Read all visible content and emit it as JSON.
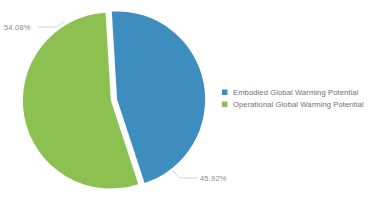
{
  "chart_data": {
    "type": "pie",
    "title": "",
    "subtitle": "",
    "xlabel": "",
    "ylabel": "",
    "categories": [
      "Embodied Global Warming Potential",
      "Operational Global Warming Potential"
    ],
    "values": [
      45.92,
      54.08
    ],
    "value_unit": "%",
    "data_labels": [
      "45.92%",
      "54.08%"
    ],
    "colors": [
      "#3d8dbe",
      "#8cc152"
    ],
    "legend_position": "right",
    "grid": false,
    "exploded": true,
    "slices": [
      {
        "name": "Embodied Global Warming Potential",
        "value": 45.92,
        "label": "45.92%",
        "color": "#3d8dbe"
      },
      {
        "name": "Operational Global Warming Potential",
        "value": 54.08,
        "label": "54.08%",
        "color": "#8cc152"
      }
    ]
  },
  "labels": {
    "green_slice_label": "54.08%",
    "blue_slice_label": "45.92%"
  },
  "legend": {
    "items": [
      {
        "label": "Embodied Global Warming Potential",
        "color": "#3d8dbe",
        "swatch": "square-swatch"
      },
      {
        "label": "Operational Global Warming Potential",
        "color": "#8cc152",
        "swatch": "square-swatch"
      }
    ]
  },
  "colors": {
    "background": "#ffffff",
    "embodied": "#3d8dbe",
    "operational": "#8cc152",
    "label_text": "#8a8a8a",
    "legend_text": "#6f6f6f",
    "leader_line": "#c9c9c9"
  }
}
